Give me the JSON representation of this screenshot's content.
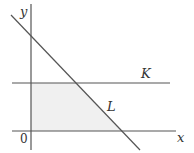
{
  "diagram": {
    "type": "coordinate-region",
    "axes": {
      "x_label": "x",
      "y_label": "y",
      "origin_label": "0"
    },
    "lines": [
      {
        "name": "K",
        "label": "K",
        "description": "horizontal line above x-axis"
      },
      {
        "name": "L",
        "label": "L",
        "description": "line with negative slope"
      }
    ],
    "shaded_region": "bounded by y-axis, x-axis, line K and line L",
    "colors": {
      "line": "#555555",
      "shade": "#f0f0f0",
      "text": "#333333"
    }
  }
}
